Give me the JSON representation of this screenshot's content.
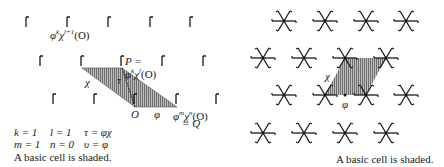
{
  "left_panel": {
    "labels": {
      "top_point": "φ",
      "top_point_exp": "k",
      "top_point_chi": "χ",
      "top_point_chi_exp": "l+1",
      "top_point_arg": "(O)",
      "P_line1": "P =",
      "P_line2_phi": "φ",
      "P_line2_phi_exp": "k",
      "P_line2_chi": "χ",
      "P_line2_chi_exp": "l",
      "P_line2_arg": "(O)",
      "chi": "χ",
      "tau": "τ",
      "origin": "O",
      "phi": "φ",
      "Q_phi": "φ",
      "Q_phi_exp": "m",
      "Q_chi": "χ",
      "Q_chi_exp": "n",
      "Q_arg": "(O)",
      "Q_eq": "= Q"
    },
    "params": {
      "k": "k = 1",
      "l": "l = 1",
      "tau": "τ = φχ",
      "m": "m = 1",
      "n": "n = 0",
      "v": "υ = φ"
    },
    "caption": "A basic cell is shaded."
  },
  "right_panel": {
    "labels": {
      "chi": "χ",
      "phi": "φ"
    },
    "caption": "A basic cell is shaded."
  },
  "colors": {
    "ink": "#1a1a1a",
    "shade": "#8c8c8c",
    "background": "#ffffff"
  }
}
